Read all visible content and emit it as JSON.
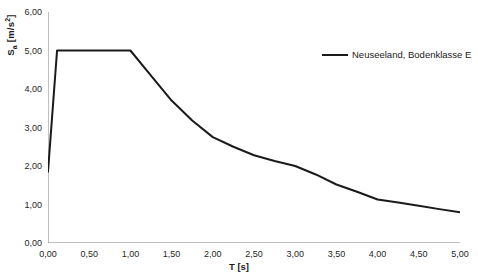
{
  "chart_data": {
    "type": "line",
    "title": "",
    "xlabel": "T [s]",
    "ylabel": "Sa [m/s2]",
    "ylabel_base": "S",
    "ylabel_sub": "a",
    "ylabel_unit_pre": " [m/s",
    "ylabel_unit_sup": "2",
    "ylabel_unit_post": "]",
    "xlim": [
      0.0,
      5.0
    ],
    "ylim": [
      0.0,
      6.0
    ],
    "xticks": [
      "0,00",
      "0,50",
      "1,00",
      "1,50",
      "2,00",
      "2,50",
      "3,00",
      "3,50",
      "4,00",
      "4,50",
      "5,00"
    ],
    "xtick_values": [
      0.0,
      0.5,
      1.0,
      1.5,
      2.0,
      2.5,
      3.0,
      3.5,
      4.0,
      4.5,
      5.0
    ],
    "yticks": [
      "0,00",
      "1,00",
      "2,00",
      "3,00",
      "4,00",
      "5,00",
      "6,00"
    ],
    "ytick_values": [
      0.0,
      1.0,
      2.0,
      3.0,
      4.0,
      5.0,
      6.0
    ],
    "grid": false,
    "legend_position": "upper right",
    "series": [
      {
        "name": "Neuseeland, Bodenklasse E",
        "color": "#1a1a1a",
        "linewidth": 2.0,
        "x": [
          0.0,
          0.11,
          1.0,
          1.25,
          1.5,
          1.75,
          2.0,
          2.25,
          2.5,
          2.75,
          3.0,
          3.25,
          3.5,
          3.75,
          4.0,
          4.25,
          4.5,
          4.75,
          5.0
        ],
        "values": [
          1.85,
          5.0,
          5.0,
          4.35,
          3.7,
          3.18,
          2.75,
          2.5,
          2.28,
          2.13,
          2.0,
          1.78,
          1.52,
          1.33,
          1.13,
          1.05,
          0.97,
          0.88,
          0.8
        ]
      }
    ]
  },
  "legend": {
    "entries": [
      {
        "label": "Neuseeland, Bodenklasse E",
        "color": "#1a1a1a"
      }
    ]
  },
  "axes": {
    "axis_color": "#808080",
    "tick_color": "#808080"
  }
}
